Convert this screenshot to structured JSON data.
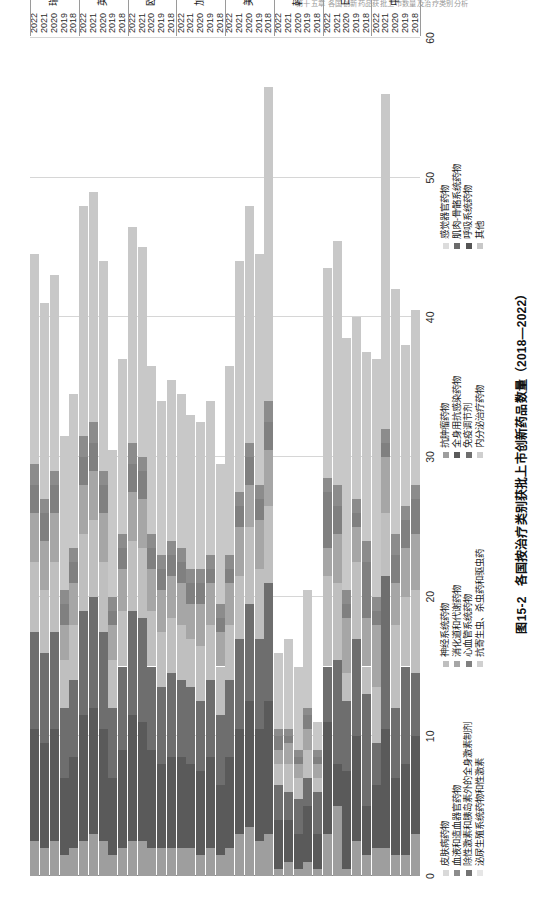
{
  "page_header": "第十五章  各国创新药品获批上市数量及治疗类别分析",
  "caption": {
    "number": "图15-2",
    "text": "各国按治疗类别获批上市创新药品数量（2018—2022）"
  },
  "axis": {
    "value_ticks": [
      "0",
      "10",
      "20",
      "30",
      "40",
      "50",
      "60"
    ],
    "value_min": 0,
    "value_max": 60,
    "value_title": ""
  },
  "legend": {
    "columns": [
      {
        "items": [
          {
            "label": "皮肤病药物",
            "color": "#d9d9d9"
          },
          {
            "label": "血液和造血器官药物",
            "color": "#8c8c8c"
          },
          {
            "label": "除性激素和胰岛素外的全身激素制剂",
            "color": "#737373"
          },
          {
            "label": "泌尿生殖系统药物和性激素",
            "color": "#e6e6e6"
          }
        ]
      },
      {
        "items": [
          {
            "label": "神经系统药物",
            "color": "#bfbfbf"
          },
          {
            "label": "消化道和代谢药物",
            "color": "#a6a6a6"
          },
          {
            "label": "心血管系统药物",
            "color": "#808080"
          },
          {
            "label": "抗寄生虫、杀虫药和驱虫药",
            "color": "#d0d0d0"
          }
        ]
      },
      {
        "items": [
          {
            "label": "抗肿瘤药物",
            "color": "#9e9e9e"
          },
          {
            "label": "全身用抗感染药物",
            "color": "#5a5a5a"
          },
          {
            "label": "免疫调节剂",
            "color": "#6e6e6e"
          },
          {
            "label": "内分泌治疗药物",
            "color": "#cfcfcf"
          }
        ]
      },
      {
        "items": [
          {
            "label": "感觉器官药物",
            "color": "#dcdcdc"
          },
          {
            "label": "肌肉-骨骼系统药物",
            "color": "#6b6b6b"
          },
          {
            "label": "呼吸系统药物",
            "color": "#555555"
          },
          {
            "label": "其他",
            "color": "#c8c8c8"
          }
        ]
      }
    ]
  },
  "chart_data": {
    "type": "bar",
    "subtype": "stacked-horizontal",
    "title": "各国按治疗类别获批上市创新药品数量（2018—2022）",
    "xlabel": "",
    "ylabel": "",
    "xlim": [
      0,
      60
    ],
    "grid": true,
    "legend_position": "bottom",
    "orientation": "rotated-90",
    "groups": [
      "中国",
      "日本",
      "韩国",
      "美国",
      "加拿大",
      "欧盟",
      "英国",
      "瑞士"
    ],
    "categories": [
      "2018",
      "2019",
      "2020",
      "2021",
      "2022"
    ],
    "series": [
      {
        "name": "抗肿瘤药物",
        "color": "#9e9e9e"
      },
      {
        "name": "全身用抗感染药物",
        "color": "#5a5a5a"
      },
      {
        "name": "免疫调节剂",
        "color": "#6e6e6e"
      },
      {
        "name": "神经系统药物",
        "color": "#bfbfbf"
      },
      {
        "name": "消化道和代谢药物",
        "color": "#a6a6a6"
      },
      {
        "name": "心血管系统药物",
        "color": "#808080"
      },
      {
        "name": "血液和造血器官药物",
        "color": "#8c8c8c"
      },
      {
        "name": "其他",
        "color": "#c8c8c8"
      }
    ],
    "bars": [
      {
        "group": "中国",
        "year": "2018",
        "total": 40.5,
        "segments": [
          3.0,
          7.0,
          4.5,
          6.0,
          4.0,
          2.5,
          1.0,
          12.5
        ]
      },
      {
        "group": "中国",
        "year": "2019",
        "total": 38.0,
        "segments": [
          1.5,
          6.5,
          7.0,
          5.0,
          3.5,
          2.0,
          1.0,
          11.5
        ]
      },
      {
        "group": "中国",
        "year": "2020",
        "total": 42.0,
        "segments": [
          1.5,
          5.5,
          5.0,
          6.0,
          3.0,
          2.0,
          1.5,
          17.5
        ]
      },
      {
        "group": "中国",
        "year": "2021",
        "total": 56.0,
        "segments": [
          2.0,
          8.5,
          11.0,
          4.5,
          4.0,
          1.0,
          1.0,
          24.0
        ]
      },
      {
        "group": "中国",
        "year": "2022",
        "total": 37.0,
        "segments": [
          2.0,
          4.5,
          3.0,
          4.0,
          4.5,
          1.0,
          1.0,
          17.0
        ]
      },
      {
        "group": "日本",
        "year": "2018",
        "total": 37.5,
        "segments": [
          1.5,
          3.5,
          8.0,
          2.0,
          3.5,
          4.0,
          1.5,
          13.5
        ]
      },
      {
        "group": "日本",
        "year": "2019",
        "total": 40.0,
        "segments": [
          2.5,
          7.5,
          7.0,
          5.5,
          2.5,
          1.0,
          1.0,
          13.0
        ]
      },
      {
        "group": "日本",
        "year": "2020",
        "total": 38.5,
        "segments": [
          0.5,
          7.0,
          5.0,
          2.0,
          4.0,
          1.0,
          1.0,
          18.0
        ]
      },
      {
        "group": "日本",
        "year": "2021",
        "total": 45.5,
        "segments": [
          5.0,
          3.0,
          7.5,
          5.5,
          3.5,
          2.0,
          1.5,
          17.5
        ]
      },
      {
        "group": "日本",
        "year": "2022",
        "total": 43.5,
        "segments": [
          3.0,
          8.0,
          4.0,
          6.5,
          2.0,
          4.0,
          1.0,
          15.0
        ]
      },
      {
        "group": "韩国",
        "year": "2018",
        "total": 11.0,
        "segments": [
          0.5,
          2.5,
          3.0,
          1.0,
          1.0,
          0.5,
          0.5,
          2.0
        ]
      },
      {
        "group": "韩国",
        "year": "2019",
        "total": 20.5,
        "segments": [
          1.0,
          4.0,
          2.0,
          2.0,
          1.5,
          1.0,
          0.5,
          8.5
        ]
      },
      {
        "group": "韩国",
        "year": "2020",
        "total": 15.0,
        "segments": [
          0.5,
          2.5,
          2.5,
          1.5,
          1.0,
          0.5,
          0.5,
          6.0
        ]
      },
      {
        "group": "韩国",
        "year": "2021",
        "total": 17.0,
        "segments": [
          1.0,
          3.0,
          2.0,
          2.0,
          1.5,
          0.5,
          0.5,
          6.5
        ]
      },
      {
        "group": "韩国",
        "year": "2022",
        "total": 16.0,
        "segments": [
          0.5,
          3.5,
          2.5,
          1.5,
          1.0,
          1.0,
          0.5,
          5.5
        ]
      },
      {
        "group": "美国",
        "year": "2018",
        "total": 56.5,
        "segments": [
          3.0,
          9.5,
          8.5,
          5.5,
          4.0,
          2.0,
          1.5,
          22.5
        ]
      },
      {
        "group": "美国",
        "year": "2019",
        "total": 44.5,
        "segments": [
          2.5,
          8.0,
          6.5,
          5.0,
          3.5,
          1.5,
          1.0,
          16.5
        ]
      },
      {
        "group": "美国",
        "year": "2020",
        "total": 48.0,
        "segments": [
          3.5,
          9.0,
          7.0,
          5.5,
          3.0,
          2.0,
          1.0,
          17.0
        ]
      },
      {
        "group": "美国",
        "year": "2021",
        "total": 44.0,
        "segments": [
          3.0,
          7.5,
          6.5,
          4.5,
          3.5,
          1.5,
          1.0,
          16.5
        ]
      },
      {
        "group": "美国",
        "year": "2022",
        "total": 36.5,
        "segments": [
          2.0,
          6.5,
          5.5,
          4.0,
          3.0,
          1.0,
          1.0,
          13.5
        ]
      },
      {
        "group": "加拿大",
        "year": "2018",
        "total": 29.5,
        "segments": [
          1.5,
          5.0,
          5.0,
          3.5,
          2.5,
          1.0,
          1.0,
          10.0
        ]
      },
      {
        "group": "加拿大",
        "year": "2019",
        "total": 34.0,
        "segments": [
          2.0,
          6.5,
          5.5,
          4.0,
          3.0,
          1.0,
          1.0,
          11.0
        ]
      },
      {
        "group": "加拿大",
        "year": "2020",
        "total": 32.5,
        "segments": [
          1.5,
          6.0,
          5.0,
          4.0,
          3.0,
          1.5,
          1.0,
          10.5
        ]
      },
      {
        "group": "加拿大",
        "year": "2021",
        "total": 33.0,
        "segments": [
          2.0,
          6.0,
          5.5,
          3.5,
          2.5,
          1.5,
          1.0,
          11.0
        ]
      },
      {
        "group": "加拿大",
        "year": "2022",
        "total": 34.5,
        "segments": [
          2.0,
          6.5,
          5.5,
          4.0,
          3.0,
          1.5,
          1.0,
          11.0
        ]
      },
      {
        "group": "欧盟",
        "year": "2018",
        "total": 35.5,
        "segments": [
          2.0,
          6.5,
          6.0,
          4.0,
          3.0,
          1.5,
          1.0,
          11.5
        ]
      },
      {
        "group": "欧盟",
        "year": "2019",
        "total": 34.0,
        "segments": [
          2.0,
          6.0,
          5.5,
          4.0,
          3.0,
          1.5,
          1.0,
          11.0
        ]
      },
      {
        "group": "欧盟",
        "year": "2020",
        "total": 36.5,
        "segments": [
          2.0,
          7.0,
          6.0,
          4.0,
          3.0,
          1.5,
          1.0,
          12.0
        ]
      },
      {
        "group": "欧盟",
        "year": "2021",
        "total": 45.0,
        "segments": [
          2.5,
          8.5,
          7.5,
          5.0,
          3.5,
          2.0,
          1.0,
          15.0
        ]
      },
      {
        "group": "欧盟",
        "year": "2022",
        "total": 46.5,
        "segments": [
          2.5,
          9.0,
          7.5,
          5.0,
          3.5,
          2.0,
          1.5,
          15.5
        ]
      },
      {
        "group": "英国",
        "year": "2018",
        "total": 37.0,
        "segments": [
          2.0,
          7.0,
          6.0,
          4.0,
          3.0,
          1.5,
          1.0,
          12.5
        ]
      },
      {
        "group": "英国",
        "year": "2019",
        "total": 30.5,
        "segments": [
          1.5,
          5.5,
          5.0,
          3.5,
          2.5,
          1.0,
          1.0,
          10.5
        ]
      },
      {
        "group": "英国",
        "year": "2020",
        "total": 44.0,
        "segments": [
          2.5,
          8.0,
          7.0,
          5.0,
          3.5,
          2.0,
          1.0,
          15.0
        ]
      },
      {
        "group": "英国",
        "year": "2021",
        "total": 49.0,
        "segments": [
          3.0,
          9.0,
          8.0,
          5.5,
          3.5,
          2.0,
          1.5,
          16.5
        ]
      },
      {
        "group": "英国",
        "year": "2022",
        "total": 48.0,
        "segments": [
          2.5,
          9.0,
          7.5,
          5.5,
          3.5,
          2.0,
          1.5,
          16.5
        ]
      },
      {
        "group": "瑞士",
        "year": "2018",
        "total": 34.5,
        "segments": [
          2.0,
          6.5,
          5.5,
          4.0,
          3.0,
          1.5,
          1.0,
          11.0
        ]
      },
      {
        "group": "瑞士",
        "year": "2019",
        "total": 31.5,
        "segments": [
          1.5,
          5.5,
          5.0,
          3.5,
          2.5,
          1.5,
          1.0,
          11.0
        ]
      },
      {
        "group": "瑞士",
        "year": "2020",
        "total": 43.0,
        "segments": [
          2.5,
          8.0,
          7.0,
          5.0,
          3.5,
          2.0,
          1.0,
          14.0
        ]
      },
      {
        "group": "瑞士",
        "year": "2021",
        "total": 41.0,
        "segments": [
          2.0,
          7.5,
          6.5,
          4.5,
          3.5,
          2.0,
          1.0,
          14.0
        ]
      },
      {
        "group": "瑞士",
        "year": "2022",
        "total": 44.5,
        "segments": [
          2.5,
          8.0,
          7.0,
          5.0,
          3.5,
          2.0,
          1.5,
          15.0
        ]
      }
    ]
  }
}
